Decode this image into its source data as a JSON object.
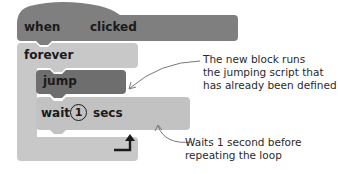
{
  "blocks": {
    "hat": {
      "word_left": "when",
      "word_right": "clicked",
      "color": "#7f7f7f"
    },
    "forever": {
      "label": "forever",
      "color": "#c8c8c8"
    },
    "jump": {
      "label": "jump",
      "color": "#6e6e6e"
    },
    "wait": {
      "label_before": "wait",
      "value": "1",
      "label_after": "secs",
      "color": "#c2c2c2"
    },
    "loop_icon": "loop-arrow-icon"
  },
  "annotations": [
    {
      "lines": [
        "The new block runs",
        "the jumping script that",
        "has already been defined"
      ]
    },
    {
      "lines": [
        "Waits 1 second before",
        "repeating the loop"
      ]
    }
  ]
}
